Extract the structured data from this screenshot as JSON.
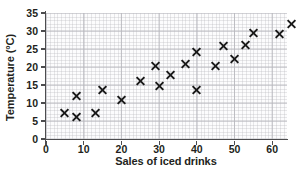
{
  "chart_data": {
    "type": "scatter",
    "title": "",
    "xlabel": "Sales of iced drinks",
    "ylabel": "Temperature (°C)",
    "xlim": [
      0,
      64
    ],
    "ylim": [
      0,
      35
    ],
    "xticks": [
      0,
      10,
      20,
      30,
      40,
      50,
      60
    ],
    "yticks": [
      0,
      5,
      10,
      15,
      20,
      25,
      30,
      35
    ],
    "grid": true,
    "minor_grid": true,
    "legend": null,
    "marker": "x",
    "marker_color": "#1a1a1a",
    "points": [
      {
        "x": 5,
        "y": 7.3
      },
      {
        "x": 8,
        "y": 6.3
      },
      {
        "x": 8,
        "y": 12.0
      },
      {
        "x": 13,
        "y": 7.3
      },
      {
        "x": 15,
        "y": 13.7
      },
      {
        "x": 20,
        "y": 11.0
      },
      {
        "x": 25,
        "y": 16.3
      },
      {
        "x": 29,
        "y": 20.3
      },
      {
        "x": 30,
        "y": 15.0
      },
      {
        "x": 33,
        "y": 18.0
      },
      {
        "x": 37,
        "y": 21.0
      },
      {
        "x": 40,
        "y": 13.7
      },
      {
        "x": 40,
        "y": 24.2
      },
      {
        "x": 45,
        "y": 20.3
      },
      {
        "x": 47,
        "y": 26.0
      },
      {
        "x": 50,
        "y": 22.4
      },
      {
        "x": 53,
        "y": 26.2
      },
      {
        "x": 55,
        "y": 29.5
      },
      {
        "x": 62,
        "y": 29.4
      },
      {
        "x": 65,
        "y": 32.2
      }
    ]
  },
  "axes": {
    "y_title": "Temperature (°C)",
    "x_title": "Sales of iced drinks",
    "y_tick_labels": [
      "0",
      "5",
      "10",
      "15",
      "20",
      "25",
      "30",
      "35"
    ],
    "x_tick_labels": [
      "0",
      "10",
      "20",
      "30",
      "40",
      "50",
      "60"
    ]
  },
  "style": {
    "background": "#ffffff",
    "plot_background": "#fcfcfd",
    "grid_color": "#b4b4b9",
    "axis_color": "#4d4d4f",
    "text_color": "#231f20"
  }
}
